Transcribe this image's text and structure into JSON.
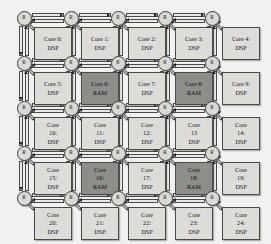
{
  "diagram": {
    "grid": {
      "rows": 5,
      "cols": 5
    },
    "router_label": "R",
    "colors": {
      "background": "#f1f1ef",
      "dsp_fill": "#dcdcd9",
      "ram_fill": "#8d8d8a",
      "router_fill": "#d9d9d6",
      "outline": "#4a4a4a",
      "arrow": "#1f1f1f"
    },
    "routers": [
      {
        "id": "R0",
        "label": "R",
        "row": 0,
        "col": 0
      },
      {
        "id": "R1",
        "label": "R",
        "row": 0,
        "col": 1
      },
      {
        "id": "R2",
        "label": "R",
        "row": 0,
        "col": 2
      },
      {
        "id": "R3",
        "label": "R",
        "row": 0,
        "col": 3
      },
      {
        "id": "R4",
        "label": "R",
        "row": 0,
        "col": 4
      },
      {
        "id": "R5",
        "label": "R",
        "row": 1,
        "col": 0
      },
      {
        "id": "R6",
        "label": "R",
        "row": 1,
        "col": 1
      },
      {
        "id": "R7",
        "label": "R",
        "row": 1,
        "col": 2
      },
      {
        "id": "R8",
        "label": "R",
        "row": 1,
        "col": 3
      },
      {
        "id": "R9",
        "label": "R",
        "row": 1,
        "col": 4
      },
      {
        "id": "R10",
        "label": "R",
        "row": 2,
        "col": 0
      },
      {
        "id": "R11",
        "label": "R",
        "row": 2,
        "col": 1
      },
      {
        "id": "R12",
        "label": "R",
        "row": 2,
        "col": 2
      },
      {
        "id": "R13",
        "label": "R",
        "row": 2,
        "col": 3
      },
      {
        "id": "R14",
        "label": "R",
        "row": 2,
        "col": 4
      },
      {
        "id": "R15",
        "label": "R",
        "row": 3,
        "col": 0
      },
      {
        "id": "R16",
        "label": "R",
        "row": 3,
        "col": 1
      },
      {
        "id": "R17",
        "label": "R",
        "row": 3,
        "col": 2
      },
      {
        "id": "R18",
        "label": "R",
        "row": 3,
        "col": 3
      },
      {
        "id": "R19",
        "label": "R",
        "row": 3,
        "col": 4
      },
      {
        "id": "R20",
        "label": "R",
        "row": 4,
        "col": 0
      },
      {
        "id": "R21",
        "label": "R",
        "row": 4,
        "col": 1
      },
      {
        "id": "R22",
        "label": "R",
        "row": 4,
        "col": 2
      },
      {
        "id": "R23",
        "label": "R",
        "row": 4,
        "col": 3
      },
      {
        "id": "R24",
        "label": "R",
        "row": 4,
        "col": 4
      }
    ],
    "cores": [
      {
        "index": 0,
        "row": 0,
        "col": 0,
        "type": "DSP",
        "lines": [
          "Core 0:",
          "DSP"
        ]
      },
      {
        "index": 1,
        "row": 0,
        "col": 1,
        "type": "DSP",
        "lines": [
          "Core 1:",
          "DSP"
        ]
      },
      {
        "index": 2,
        "row": 0,
        "col": 2,
        "type": "DSP",
        "lines": [
          "Core 2:",
          "DSP"
        ]
      },
      {
        "index": 3,
        "row": 0,
        "col": 3,
        "type": "DSP",
        "lines": [
          "Core 3:",
          "DSP"
        ]
      },
      {
        "index": 4,
        "row": 0,
        "col": 4,
        "type": "DSP",
        "lines": [
          "Core 4:",
          "DSP"
        ]
      },
      {
        "index": 5,
        "row": 1,
        "col": 0,
        "type": "DSP",
        "lines": [
          "Core 5:",
          "DSP"
        ]
      },
      {
        "index": 6,
        "row": 1,
        "col": 1,
        "type": "RAM",
        "lines": [
          "Core 6:",
          "RAM"
        ]
      },
      {
        "index": 7,
        "row": 1,
        "col": 2,
        "type": "DSP",
        "lines": [
          "Core 7:",
          "DSP"
        ]
      },
      {
        "index": 8,
        "row": 1,
        "col": 3,
        "type": "RAM",
        "lines": [
          "Core 8:",
          "RAM"
        ]
      },
      {
        "index": 9,
        "row": 1,
        "col": 4,
        "type": "DSP",
        "lines": [
          "Core 9:",
          "DSP"
        ]
      },
      {
        "index": 10,
        "row": 2,
        "col": 0,
        "type": "DSP",
        "lines": [
          "Core",
          "10:",
          "DSP"
        ]
      },
      {
        "index": 11,
        "row": 2,
        "col": 1,
        "type": "DSP",
        "lines": [
          "Core",
          "11:",
          "DSP"
        ]
      },
      {
        "index": 12,
        "row": 2,
        "col": 2,
        "type": "DSP",
        "lines": [
          "Core",
          "12:",
          "DSP"
        ]
      },
      {
        "index": 13,
        "row": 2,
        "col": 3,
        "type": "DSP",
        "lines": [
          "Core",
          "13",
          "DSP"
        ]
      },
      {
        "index": 14,
        "row": 2,
        "col": 4,
        "type": "DSP",
        "lines": [
          "Core",
          "14:",
          "DSP"
        ]
      },
      {
        "index": 15,
        "row": 3,
        "col": 0,
        "type": "DSP",
        "lines": [
          "Core",
          "15:",
          "DSP"
        ]
      },
      {
        "index": 16,
        "row": 3,
        "col": 1,
        "type": "RAM",
        "lines": [
          "Core",
          "16:",
          "RAM"
        ]
      },
      {
        "index": 17,
        "row": 3,
        "col": 2,
        "type": "DSP",
        "lines": [
          "Core",
          "17:",
          "DSP"
        ]
      },
      {
        "index": 18,
        "row": 3,
        "col": 3,
        "type": "RAM",
        "lines": [
          "Core",
          "18:",
          "RAM"
        ]
      },
      {
        "index": 19,
        "row": 3,
        "col": 4,
        "type": "DSP",
        "lines": [
          "Core",
          "19:",
          "DSP"
        ]
      },
      {
        "index": 20,
        "row": 4,
        "col": 0,
        "type": "DSP",
        "lines": [
          "Core",
          "20:",
          "DSP"
        ]
      },
      {
        "index": 21,
        "row": 4,
        "col": 1,
        "type": "DSP",
        "lines": [
          "Core",
          "21:",
          "DSP"
        ]
      },
      {
        "index": 22,
        "row": 4,
        "col": 2,
        "type": "DSP",
        "lines": [
          "Core",
          "22:",
          "DSP"
        ]
      },
      {
        "index": 23,
        "row": 4,
        "col": 3,
        "type": "DSP",
        "lines": [
          "Core",
          "23:",
          "DSP"
        ]
      },
      {
        "index": 24,
        "row": 4,
        "col": 4,
        "type": "DSP",
        "lines": [
          "Core",
          "24:",
          "DSP"
        ]
      }
    ]
  }
}
